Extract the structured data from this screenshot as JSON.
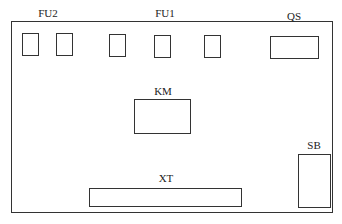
{
  "diagram": {
    "type": "electrical-panel-layout",
    "labels": {
      "fu2": "FU2",
      "fu1": "FU1",
      "qs": "QS",
      "km": "KM",
      "sb": "SB",
      "xt": "XT"
    },
    "components": [
      {
        "id": "fu2-1",
        "group": "FU2"
      },
      {
        "id": "fu2-2",
        "group": "FU2"
      },
      {
        "id": "fu1-1",
        "group": "FU1"
      },
      {
        "id": "fu1-2",
        "group": "FU1"
      },
      {
        "id": "fu1-3",
        "group": "FU1"
      },
      {
        "id": "qs",
        "group": "QS"
      },
      {
        "id": "km",
        "group": "KM"
      },
      {
        "id": "sb",
        "group": "SB"
      },
      {
        "id": "xt",
        "group": "XT"
      }
    ]
  }
}
